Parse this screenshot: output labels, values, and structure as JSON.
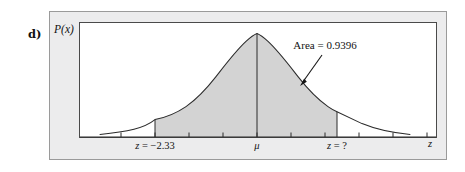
{
  "figure": {
    "part_label": "d)",
    "y_axis_label": "P(x)",
    "x_axis_label": "z",
    "annotation": "Area = 0.9396",
    "left_bound_label": "z = −2.33",
    "mean_label": "μ",
    "right_bound_label": "z = ?",
    "colors": {
      "shaded_area": "#d3d3d3",
      "curve_stroke": "#2b2b2b",
      "panel_background": "#ffffff",
      "plate_background": "#ececed",
      "plate_border": "#9a9a9a",
      "panel_border": "#4a4a4a",
      "text": "#111111"
    }
  },
  "chart_data": {
    "type": "area",
    "title": "",
    "subtitle": "",
    "xlabel": "z",
    "ylabel": "P(x)",
    "distribution": "normal",
    "mean": 0,
    "grid": false,
    "legend": null,
    "xlim": [
      -4.0,
      4.0
    ],
    "ylim": [
      0,
      0.42
    ],
    "shaded_region": {
      "from": -2.33,
      "to": null,
      "to_label": "?",
      "area": 0.9396,
      "label": "Area = 0.9396",
      "fill": "#d3d3d3"
    },
    "tick_labels": [
      {
        "value": -2.33,
        "text": "z = −2.33"
      },
      {
        "value": 0,
        "text": "μ"
      },
      {
        "value": 1.55,
        "text": "z = ?"
      }
    ],
    "tick_values": [
      -3.0,
      -2.33,
      -1.5,
      -0.75,
      0,
      0.75,
      1.5,
      2.25,
      3.0,
      3.75
    ],
    "annotations": [
      {
        "text": "Area = 0.9396",
        "points_to": "shaded region boundary",
        "arrow": true
      }
    ],
    "x": [
      -4.0,
      -3.6,
      -3.2,
      -2.8,
      -2.4,
      -2.0,
      -1.6,
      -1.2,
      -0.8,
      -0.4,
      0.0,
      0.4,
      0.8,
      1.2,
      1.6,
      2.0,
      2.4,
      2.8,
      3.2,
      3.6,
      4.0
    ],
    "y": [
      0.0001,
      0.0006,
      0.0024,
      0.0079,
      0.0224,
      0.054,
      0.1109,
      0.1942,
      0.2897,
      0.3683,
      0.3989,
      0.3683,
      0.2897,
      0.1942,
      0.1109,
      0.054,
      0.0224,
      0.0079,
      0.0024,
      0.0006,
      0.0001
    ]
  }
}
